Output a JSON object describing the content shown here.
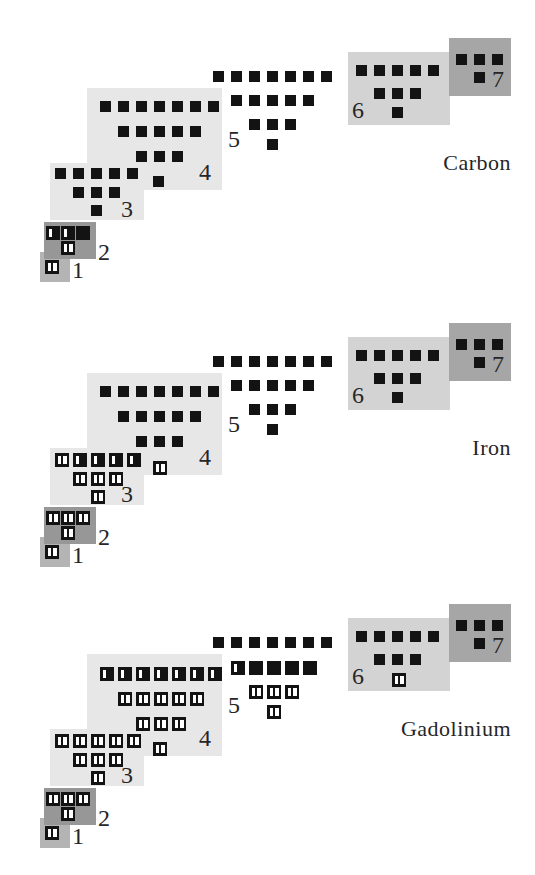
{
  "figure_type": "electron-orbital-filling-diagrams",
  "colors": {
    "background": "#ffffff",
    "orbital_fill": "#131313",
    "electron_mark": "#ffffff",
    "text": "#262626"
  },
  "shell_groups": [
    {
      "number": "1",
      "bg_color": "#b4b4b4",
      "subshells": {
        "s": 1
      }
    },
    {
      "number": "2",
      "bg_color": "#979797",
      "subshells": {
        "p": 3,
        "s": 1
      }
    },
    {
      "number": "3",
      "bg_color": "#e7e7e7",
      "subshells": {
        "d": 5,
        "p": 3,
        "s": 1
      }
    },
    {
      "number": "4",
      "bg_color": "#e7e7e7",
      "subshells": {
        "f": 7,
        "d": 5,
        "p": 3,
        "s": 1
      }
    },
    {
      "number": "5",
      "bg_color": null,
      "subshells": {
        "f": 7,
        "d": 5,
        "p": 3,
        "s": 1
      }
    },
    {
      "number": "6",
      "bg_color": "#d3d3d3",
      "subshells": {
        "d": 5,
        "p": 3,
        "s": 1
      }
    },
    {
      "number": "7",
      "bg_color": "#a6a6a6",
      "subshells": {
        "p": 3,
        "s": 1
      }
    }
  ],
  "diagrams": [
    {
      "element": "Carbon",
      "occupancy": {
        "1": {
          "s": [
            2
          ]
        },
        "2": {
          "p": [
            1,
            1,
            0
          ],
          "s": [
            2
          ]
        },
        "3": {
          "d": [
            0,
            0,
            0,
            0,
            0
          ],
          "p": [
            0,
            0,
            0
          ],
          "s": [
            0
          ]
        },
        "4": {
          "f": [
            0,
            0,
            0,
            0,
            0,
            0,
            0
          ],
          "d": [
            0,
            0,
            0,
            0,
            0
          ],
          "p": [
            0,
            0,
            0
          ],
          "s": [
            0
          ]
        },
        "5": {
          "f": [
            0,
            0,
            0,
            0,
            0,
            0,
            0
          ],
          "d": [
            0,
            0,
            0,
            0,
            0
          ],
          "p": [
            0,
            0,
            0
          ],
          "s": [
            0
          ]
        },
        "6": {
          "d": [
            0,
            0,
            0,
            0,
            0
          ],
          "p": [
            0,
            0,
            0
          ],
          "s": [
            0
          ]
        },
        "7": {
          "p": [
            0,
            0,
            0
          ],
          "s": [
            0
          ]
        }
      }
    },
    {
      "element": "Iron",
      "occupancy": {
        "1": {
          "s": [
            2
          ]
        },
        "2": {
          "p": [
            2,
            2,
            2
          ],
          "s": [
            2
          ]
        },
        "3": {
          "d": [
            2,
            1,
            1,
            1,
            1
          ],
          "p": [
            2,
            2,
            2
          ],
          "s": [
            2
          ]
        },
        "4": {
          "f": [
            0,
            0,
            0,
            0,
            0,
            0,
            0
          ],
          "d": [
            0,
            0,
            0,
            0,
            0
          ],
          "p": [
            0,
            0,
            0
          ],
          "s": [
            2
          ]
        },
        "5": {
          "f": [
            0,
            0,
            0,
            0,
            0,
            0,
            0
          ],
          "d": [
            0,
            0,
            0,
            0,
            0
          ],
          "p": [
            0,
            0,
            0
          ],
          "s": [
            0
          ]
        },
        "6": {
          "d": [
            0,
            0,
            0,
            0,
            0
          ],
          "p": [
            0,
            0,
            0
          ],
          "s": [
            0
          ]
        },
        "7": {
          "p": [
            0,
            0,
            0
          ],
          "s": [
            0
          ]
        }
      }
    },
    {
      "element": "Gadolinium",
      "occupancy": {
        "1": {
          "s": [
            2
          ]
        },
        "2": {
          "p": [
            2,
            2,
            2
          ],
          "s": [
            2
          ]
        },
        "3": {
          "d": [
            2,
            2,
            2,
            2,
            2
          ],
          "p": [
            2,
            2,
            2
          ],
          "s": [
            2
          ]
        },
        "4": {
          "f": [
            1,
            1,
            1,
            1,
            1,
            1,
            1
          ],
          "d": [
            2,
            2,
            2,
            2,
            2
          ],
          "p": [
            2,
            2,
            2
          ],
          "s": [
            2
          ]
        },
        "5": {
          "f": [
            0,
            0,
            0,
            0,
            0,
            0,
            0
          ],
          "d": [
            1,
            0,
            0,
            0,
            0
          ],
          "p": [
            2,
            2,
            2
          ],
          "s": [
            2
          ]
        },
        "6": {
          "d": [
            0,
            0,
            0,
            0,
            0
          ],
          "p": [
            0,
            0,
            0
          ],
          "s": [
            2
          ]
        },
        "7": {
          "p": [
            0,
            0,
            0
          ],
          "s": [
            0
          ]
        }
      }
    }
  ]
}
